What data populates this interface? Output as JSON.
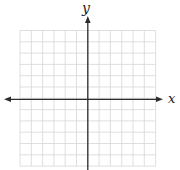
{
  "figure": {
    "background_color": "#ffffff",
    "grid_line_color": "#d7d7d7",
    "axis_color": "#2d2d2d",
    "label_color": "#1c1c1c"
  },
  "chart_data": {
    "type": "scatter",
    "title": "",
    "series": [],
    "xlabel": "x",
    "ylabel": "y",
    "xlim": [
      -6,
      6
    ],
    "ylim": [
      -6,
      6
    ],
    "grid": true,
    "grid_cols": 12,
    "grid_rows": 12,
    "tick_labels_shown": false,
    "x_axis_arrows": "both",
    "y_axis_arrows": "top"
  }
}
